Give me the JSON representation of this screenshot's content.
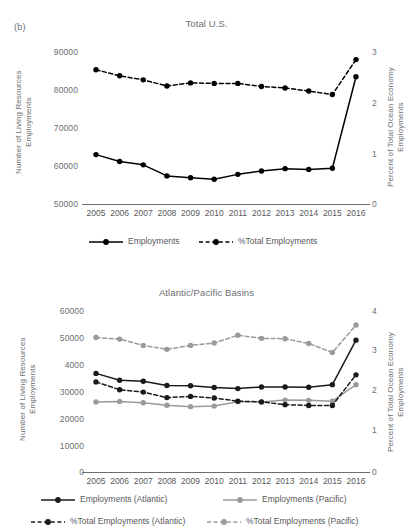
{
  "figure": {
    "panel_label": "(b)"
  },
  "charts": [
    {
      "id": "total-us",
      "title": "Total U.S.",
      "ylabel_left": "Number of Living Resources Employments",
      "ylabel_right": "Percent of Total Ocean Economy Employments",
      "yticks_left": [
        "90000",
        "80000",
        "70000",
        "60000",
        "50000"
      ],
      "yticks_right": [
        "3",
        "2",
        "1",
        "0"
      ],
      "xticks": [
        "2005",
        "2006",
        "2007",
        "2008",
        "2009",
        "2010",
        "2011",
        "2012",
        "2013",
        "2014",
        "2015",
        "2016"
      ],
      "legend": [
        {
          "label": "Employments",
          "style": "solid",
          "color": "#000000"
        },
        {
          "label": "%Total Employments",
          "style": "dashed",
          "color": "#000000"
        }
      ]
    },
    {
      "id": "atlantic-pacific",
      "title": "Atlantic/Pacific Basins",
      "ylabel_left": "Number of Living Resources Employments",
      "ylabel_right": "Percent of Total Ocean Economy Employments",
      "yticks_left": [
        "60000",
        "50000",
        "4000",
        "30000",
        "20000",
        "10000",
        "0"
      ],
      "yticks_right": [
        "4",
        "3",
        "2",
        "1",
        "0"
      ],
      "xticks": [
        "2005",
        "2006",
        "2007",
        "2008",
        "2009",
        "2010",
        "2011",
        "2012",
        "2013",
        "2014",
        "2015",
        "2016"
      ],
      "legend": [
        {
          "label": "Employments (Atlantic)",
          "style": "solid",
          "color": "#1a1a1a"
        },
        {
          "label": "Employments (Pacific)",
          "style": "solid",
          "color": "#9a9a9a"
        },
        {
          "label": "%Total Employments (Atlantic)",
          "style": "dashed",
          "color": "#1a1a1a"
        },
        {
          "label": "%Total Employments (Pacific)",
          "style": "dashed",
          "color": "#9a9a9a"
        }
      ]
    }
  ],
  "chart_data": [
    {
      "type": "line",
      "title": "Total U.S.",
      "xlabel": "",
      "ylabel": "Number of Living Resources Employments",
      "ylabel2": "Percent of Total Ocean Economy Employments",
      "x": [
        "2005",
        "2006",
        "2007",
        "2008",
        "2009",
        "2010",
        "2011",
        "2012",
        "2013",
        "2014",
        "2015",
        "2016"
      ],
      "ylim": [
        50000,
        90000
      ],
      "ylim2": [
        0,
        3
      ],
      "grid": false,
      "legend_position": "bottom",
      "series": [
        {
          "name": "Employments",
          "axis": "left",
          "style": "solid",
          "color": "#000000",
          "marker": "circle",
          "values": [
            63000,
            61200,
            60300,
            57400,
            56900,
            56500,
            57800,
            58700,
            59300,
            59100,
            59400,
            83500
          ]
        },
        {
          "name": "%Total Employments",
          "axis": "right",
          "style": "dashed",
          "color": "#000000",
          "marker": "circle",
          "values": [
            2.65,
            2.53,
            2.45,
            2.33,
            2.39,
            2.38,
            2.38,
            2.32,
            2.29,
            2.23,
            2.16,
            2.85
          ]
        }
      ]
    },
    {
      "type": "line",
      "title": "Atlantic/Pacific Basins",
      "xlabel": "",
      "ylabel": "Number of Living Resources Employments",
      "ylabel2": "Percent of Total Ocean Economy Employments",
      "x": [
        "2005",
        "2006",
        "2007",
        "2008",
        "2009",
        "2010",
        "2011",
        "2012",
        "2013",
        "2014",
        "2015",
        "2016"
      ],
      "ylim": [
        0,
        60000
      ],
      "ylim2": [
        0,
        4
      ],
      "grid": false,
      "legend_position": "bottom",
      "series": [
        {
          "name": "Employments (Atlantic)",
          "axis": "left",
          "style": "solid",
          "color": "#1a1a1a",
          "marker": "circle",
          "values": [
            37300,
            34700,
            34300,
            32700,
            32600,
            31900,
            31500,
            32100,
            32100,
            32000,
            33000,
            50000
          ]
        },
        {
          "name": "Employments (Pacific)",
          "axis": "left",
          "style": "solid",
          "color": "#9a9a9a",
          "marker": "circle",
          "values": [
            26400,
            26600,
            26100,
            25100,
            24600,
            24800,
            26500,
            26400,
            27100,
            27000,
            26700,
            33000
          ]
        },
        {
          "name": "%Total Employments (Atlantic)",
          "axis": "right",
          "style": "dashed",
          "color": "#1a1a1a",
          "marker": "circle",
          "values": [
            2.27,
            2.07,
            2.01,
            1.87,
            1.9,
            1.86,
            1.78,
            1.76,
            1.69,
            1.67,
            1.67,
            2.45
          ]
        },
        {
          "name": "%Total Employments (Pacific)",
          "axis": "right",
          "style": "dashed",
          "color": "#9a9a9a",
          "marker": "circle",
          "values": [
            3.4,
            3.36,
            3.2,
            3.1,
            3.2,
            3.26,
            3.46,
            3.38,
            3.37,
            3.25,
            3.02,
            3.72
          ]
        }
      ]
    }
  ]
}
